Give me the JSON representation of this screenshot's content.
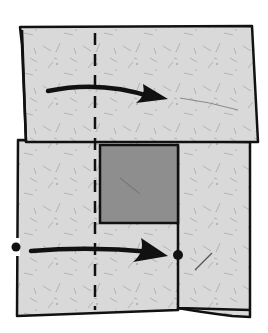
{
  "diagram": {
    "type": "origami-fold-step",
    "colors": {
      "background": "#ffffff",
      "paper": "#d9d9d9",
      "paper_speckle": "#9a9a9a",
      "inner_square": "#8e8e8e",
      "outline": "#111111"
    },
    "elements": {
      "fold_line": {
        "style": "dashed",
        "kind": "valley-fold",
        "x": 95,
        "y_start": 33,
        "y_end": 310
      },
      "upper_arrow": {
        "from": [
          48,
          90
        ],
        "to": [
          168,
          98
        ],
        "meaning": "fold over to the right"
      },
      "lower_arrow": {
        "from": [
          31,
          250
        ],
        "to": [
          168,
          254
        ],
        "meaning": "bring dot to dot"
      },
      "reference_dots": [
        {
          "name": "left-edge-dot",
          "x": 16,
          "y": 247
        },
        {
          "name": "target-dot",
          "x": 178,
          "y": 255
        }
      ],
      "inner_square": {
        "x": 100,
        "y": 145,
        "width": 78,
        "height": 78
      }
    }
  }
}
